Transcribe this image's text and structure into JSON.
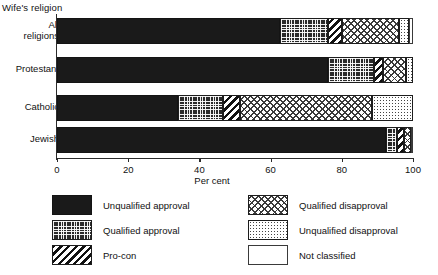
{
  "chart_data": {
    "type": "bar",
    "orientation": "horizontal",
    "stacked": true,
    "title": "",
    "ylabel": "Wife's religion",
    "xlabel": "Per cent",
    "xlim": [
      0,
      100
    ],
    "xticks": [
      0,
      20,
      40,
      60,
      80,
      100
    ],
    "xticklabels": [
      "0",
      "20",
      "40",
      "60",
      "80",
      "100"
    ],
    "grid": false,
    "legend_position": "bottom",
    "categories": [
      "All religions",
      "Protestant",
      "Catholic",
      "Jewish"
    ],
    "series": [
      {
        "name": "Unqualified approval",
        "values": [
          62.5,
          76.0,
          34.0,
          92.5
        ]
      },
      {
        "name": "Qualified approval",
        "values": [
          13.5,
          13.0,
          12.5,
          3.0
        ]
      },
      {
        "name": "Pro-con",
        "values": [
          4.0,
          2.5,
          5.0,
          2.0
        ]
      },
      {
        "name": "Qualified disapproval",
        "values": [
          16.0,
          6.5,
          37.0,
          2.0
        ]
      },
      {
        "name": "Unqualified disapproval",
        "values": [
          3.0,
          2.0,
          11.5,
          0.0
        ]
      },
      {
        "name": "Not classified",
        "values": [
          1.0,
          0.0,
          0.0,
          0.5
        ]
      }
    ]
  },
  "axes": {
    "y_axis_title": "Wife's religion",
    "x_axis_title": "Per cent",
    "category_labels": [
      "All\nreligions",
      "Protestant",
      "Catholic",
      "Jewish"
    ],
    "tick_labels": [
      "0",
      "20",
      "40",
      "60",
      "80",
      "100"
    ]
  },
  "legend": {
    "left_column": [
      {
        "label": "Unqualified approval",
        "pattern": "solid-black"
      },
      {
        "label": "Qualified approval",
        "pattern": "fine-grid"
      },
      {
        "label": "Pro-con",
        "pattern": "diagonal-stripe"
      }
    ],
    "right_column": [
      {
        "label": "Qualified disapproval",
        "pattern": "checker"
      },
      {
        "label": "Unqualified disapproval",
        "pattern": "dotted"
      },
      {
        "label": "Not classified",
        "pattern": "empty-white"
      }
    ]
  },
  "colors": {
    "ink": "#1a1a1a",
    "axis": "#2b2b2b",
    "background": "#ffffff"
  }
}
